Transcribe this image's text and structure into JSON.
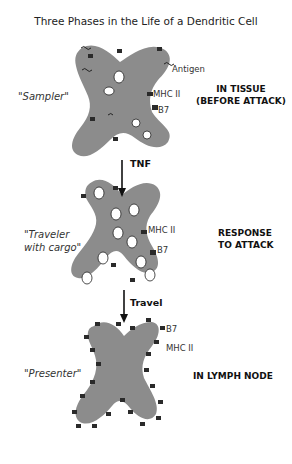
{
  "title": "Three Phases in the Life of a Dendritic Cell",
  "colors": {
    "cell_fill": "#8c8c8c",
    "receptor": "#2a2a2a",
    "text": "#222222"
  },
  "phases": [
    {
      "nickname": "\"Sampler\"",
      "phase_line1": "IN TISSUE",
      "phase_line2": "(BEFORE ATTACK)",
      "labels": {
        "antigen": "Antigen",
        "mhc": "MHC II",
        "b7": "B7"
      }
    },
    {
      "nickname_line1": "\"Traveler",
      "nickname_line2": "with cargo\"",
      "phase_line1": "RESPONSE",
      "phase_line2": "TO ATTACK",
      "labels": {
        "mhc": "MHC II",
        "b7": "B7"
      }
    },
    {
      "nickname": "\"Presenter\"",
      "phase_line1": "IN LYMPH NODE",
      "labels": {
        "b7": "B7",
        "mhc": "MHC II"
      }
    }
  ],
  "arrows": [
    {
      "label": "TNF"
    },
    {
      "label": "Travel"
    }
  ]
}
